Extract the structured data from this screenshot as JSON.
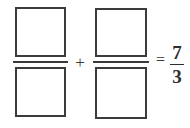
{
  "equation": {
    "description": "Fraction addition with two blank answer boxes equal to seven thirds",
    "operator_add": "+",
    "operator_equals": "=",
    "terms": [
      {
        "name": "first-blank-fraction",
        "numerator_value": "",
        "denominator_value": "",
        "numerator_placeholder": "",
        "denominator_placeholder": ""
      },
      {
        "name": "second-blank-fraction",
        "numerator_value": "",
        "denominator_value": "",
        "numerator_placeholder": "",
        "denominator_placeholder": ""
      }
    ],
    "result": {
      "numerator": "7",
      "denominator": "3"
    }
  },
  "colors": {
    "ink": "#3b3b3b",
    "result_ink": "#2e2e2e",
    "page_background": "#ffffff",
    "box_fill": "#ffffff"
  }
}
